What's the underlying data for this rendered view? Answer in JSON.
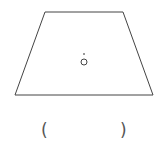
{
  "figure": {
    "shape": "trapezoid",
    "vertices": {
      "top_left": [
        45,
        12
      ],
      "top_right": [
        123,
        12
      ],
      "bottom_right": [
        153,
        95
      ],
      "bottom_left": [
        15,
        95
      ]
    },
    "stroke_color": "#444444",
    "center_point": {
      "label": "O",
      "x": 84,
      "y": 62,
      "marker_color": "#999999"
    }
  },
  "answer_blank": {
    "open_paren": "(",
    "close_paren": ")"
  }
}
